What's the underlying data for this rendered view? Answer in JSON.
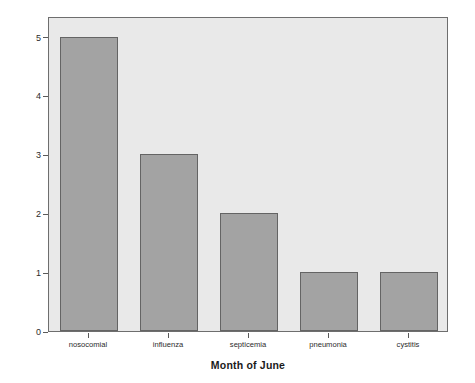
{
  "chart_data": {
    "type": "bar",
    "title": "",
    "xlabel": "Month of June",
    "ylabel": "Count",
    "categories": [
      "nosocomial",
      "influenza",
      "septicemia",
      "pneumonia",
      "cystitis"
    ],
    "values": [
      5,
      3,
      2,
      1,
      1
    ],
    "ylim": [
      0,
      5.35
    ],
    "yticks": [
      0,
      1,
      2,
      3,
      4,
      5
    ],
    "ytick_labels": [
      "0",
      "1",
      "2",
      "3",
      "4",
      "5"
    ],
    "grid": false,
    "legend": "none",
    "colors": {
      "bar_fill": "#a3a3a3",
      "bar_edge": "#646464",
      "plot_background": "#e9e9e9",
      "frame": "#6e6e6e",
      "figure_background": "#ffffff",
      "text": "#1a1a1a"
    }
  }
}
